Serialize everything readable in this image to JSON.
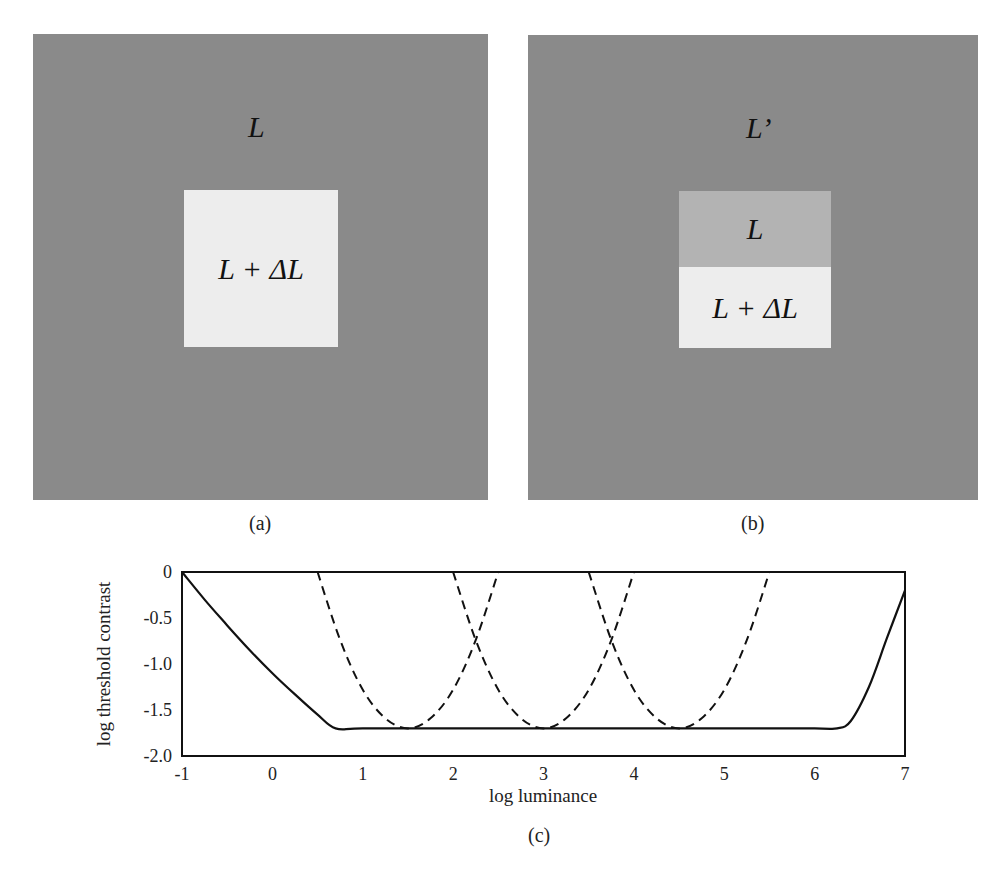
{
  "panels": {
    "a": {
      "surround_label": "L",
      "center_label": "L + ΔL",
      "caption": "(a)",
      "colors": {
        "surround": "#8a8a8a",
        "center": "#ededed"
      }
    },
    "b": {
      "surround_label": "L’",
      "center_top_label": "L",
      "center_bottom_label": "L + ΔL",
      "caption": "(b)",
      "colors": {
        "surround": "#8a8a8a",
        "center_top": "#b3b3b3",
        "center_bottom": "#ededed"
      }
    },
    "c": {
      "caption": "(c)"
    }
  },
  "chart_data": {
    "type": "line",
    "title": "",
    "xlabel": "log luminance",
    "ylabel": "log threshold contrast",
    "xlim": [
      -1,
      7
    ],
    "ylim": [
      -2.0,
      0
    ],
    "xticks": [
      "-1",
      "0",
      "1",
      "2",
      "3",
      "4",
      "5",
      "6",
      "7"
    ],
    "yticks": [
      "0",
      "-0.5",
      "-1.0",
      "-1.5",
      "-2.0"
    ],
    "grid": false,
    "legend": null,
    "series": [
      {
        "name": "global threshold (solid)",
        "style": "solid",
        "x": [
          -1,
          -0.75,
          -0.5,
          -0.25,
          0,
          0.25,
          0.5,
          0.7,
          1,
          2,
          3,
          4,
          5,
          6,
          6.25,
          6.4,
          6.6,
          6.8,
          7
        ],
        "y": [
          0,
          -0.3,
          -0.58,
          -0.85,
          -1.1,
          -1.33,
          -1.55,
          -1.7,
          -1.7,
          -1.7,
          -1.7,
          -1.7,
          -1.7,
          -1.7,
          -1.7,
          -1.62,
          -1.25,
          -0.72,
          -0.2
        ]
      },
      {
        "name": "adaptation level 1 (dashed)",
        "style": "dashed",
        "x": [
          0.5,
          0.75,
          1.0,
          1.25,
          1.5,
          1.75,
          2.0,
          2.25,
          2.5
        ],
        "y": [
          0,
          -0.74,
          -1.28,
          -1.59,
          -1.7,
          -1.59,
          -1.28,
          -0.74,
          0
        ]
      },
      {
        "name": "adaptation level 2 (dashed)",
        "style": "dashed",
        "x": [
          2.0,
          2.25,
          2.5,
          2.75,
          3.0,
          3.25,
          3.5,
          3.75,
          4.0
        ],
        "y": [
          0,
          -0.74,
          -1.28,
          -1.59,
          -1.7,
          -1.59,
          -1.28,
          -0.74,
          0
        ]
      },
      {
        "name": "adaptation level 3 (dashed)",
        "style": "dashed",
        "x": [
          3.5,
          3.75,
          4.0,
          4.25,
          4.5,
          4.75,
          5.0,
          5.25,
          5.5
        ],
        "y": [
          0,
          -0.74,
          -1.28,
          -1.59,
          -1.7,
          -1.59,
          -1.28,
          -0.74,
          0
        ]
      }
    ]
  }
}
